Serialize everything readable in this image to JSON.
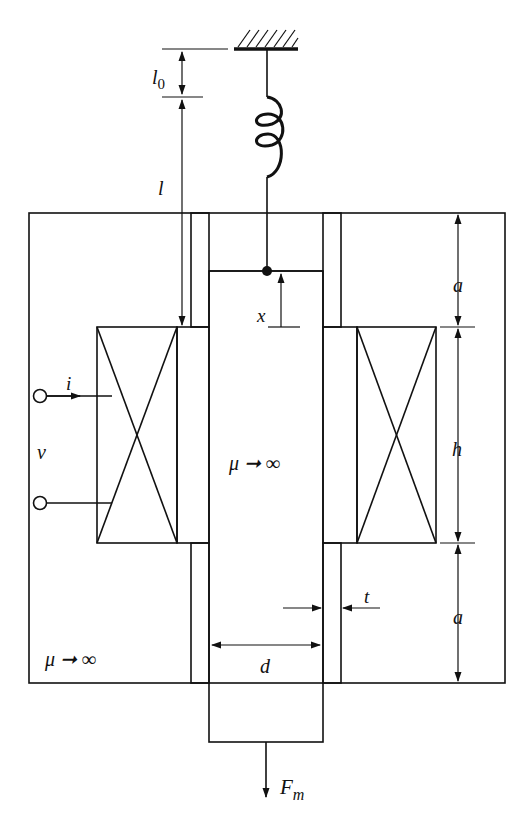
{
  "diagram": {
    "colors": {
      "line": "#111111",
      "background": "#ffffff"
    },
    "labels": {
      "l0": "l",
      "l0_sub": "0",
      "l": "l",
      "x": "x",
      "a_top": "a",
      "h": "h",
      "a_bottom": "a",
      "i": "i",
      "v": "v",
      "mu_plunger": "μ ➞ ∞",
      "mu_core": "μ ➞ ∞",
      "d": "d",
      "t": "t",
      "Fm": "F",
      "Fm_sub": "m"
    },
    "components": [
      {
        "id": "ground",
        "label": "fixed support"
      },
      {
        "id": "spring",
        "label": "spring"
      },
      {
        "id": "outer-core",
        "label": "magnetic core μ→∞"
      },
      {
        "id": "plunger",
        "label": "plunger μ→∞"
      },
      {
        "id": "non-magnetic-sleeve",
        "label": "sleeve thickness t"
      },
      {
        "id": "coil",
        "label": "excitation coil"
      },
      {
        "id": "terminals",
        "label": "voltage terminals v, current i"
      }
    ]
  }
}
